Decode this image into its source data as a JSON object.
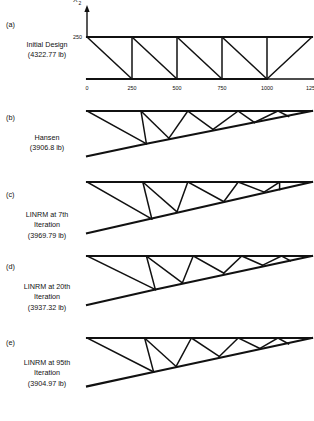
{
  "figure": {
    "line_color": "#111111",
    "background": "#ffffff"
  },
  "chart_data": {
    "type": "line",
    "xlabel": "X 1",
    "ylabel": "X 2",
    "axes": {
      "x_ticks": [
        0,
        250,
        500,
        750,
        1000,
        1250
      ],
      "x_tick_labels": [
        "0",
        "250",
        "500",
        "750",
        "1000",
        "1250"
      ],
      "y_ticks": [
        250
      ],
      "y_tick_labels": [
        "250"
      ],
      "xlim": [
        0,
        1250
      ],
      "ylim": [
        0,
        250
      ],
      "grid": false,
      "legend": "none"
    },
    "panels": [
      {
        "tag": "(a)",
        "name": "Initial Design",
        "weight": "(4322.77 lb)",
        "caption_lines": [
          "Initial Design",
          "(4322.77 lb)"
        ],
        "has_axes": true,
        "top_nodes": [
          [
            0,
            250
          ],
          [
            250,
            250
          ],
          [
            500,
            250
          ],
          [
            750,
            250
          ],
          [
            1000,
            250
          ],
          [
            1250,
            250
          ]
        ],
        "bottom_nodes": [
          [
            0,
            0
          ],
          [
            250,
            0
          ],
          [
            500,
            0
          ],
          [
            750,
            0
          ],
          [
            1000,
            0
          ]
        ],
        "top_chord": [
          [
            0,
            250
          ],
          [
            1250,
            250
          ]
        ],
        "bottom_chord": [
          [
            0,
            0
          ],
          [
            1000,
            0
          ]
        ],
        "web_members": [
          [
            [
              0,
              250
            ],
            [
              250,
              0
            ]
          ],
          [
            [
              250,
              250
            ],
            [
              250,
              0
            ]
          ],
          [
            [
              250,
              250
            ],
            [
              500,
              0
            ]
          ],
          [
            [
              500,
              250
            ],
            [
              500,
              0
            ]
          ],
          [
            [
              500,
              250
            ],
            [
              750,
              0
            ]
          ],
          [
            [
              750,
              250
            ],
            [
              750,
              0
            ]
          ],
          [
            [
              750,
              250
            ],
            [
              1000,
              0
            ]
          ],
          [
            [
              1000,
              250
            ],
            [
              1000,
              0
            ]
          ],
          [
            [
              1250,
              250
            ],
            [
              1000,
              0
            ]
          ]
        ]
      },
      {
        "tag": "(b)",
        "name": "Hansen",
        "weight": "(3906.8 lb)",
        "caption_lines": [
          "Hansen",
          "(3906.8 lb)"
        ],
        "has_axes": false,
        "top_chord": [
          [
            0,
            250
          ],
          [
            1250,
            250
          ]
        ],
        "bottom_chord": [
          [
            0,
            -20
          ],
          [
            330,
            55
          ],
          [
            1250,
            250
          ]
        ],
        "web_members": [
          [
            [
              0,
              250
            ],
            [
              330,
              55
            ]
          ],
          [
            [
              300,
              250
            ],
            [
              330,
              55
            ]
          ],
          [
            [
              300,
              250
            ],
            [
              455,
              88
            ]
          ],
          [
            [
              560,
              250
            ],
            [
              455,
              88
            ]
          ],
          [
            [
              560,
              250
            ],
            [
              700,
              140
            ]
          ],
          [
            [
              840,
              250
            ],
            [
              700,
              140
            ]
          ],
          [
            [
              840,
              250
            ],
            [
              930,
              182
            ]
          ],
          [
            [
              1060,
              250
            ],
            [
              930,
              182
            ]
          ],
          [
            [
              1060,
              250
            ],
            [
              1120,
              218
            ]
          ]
        ]
      },
      {
        "tag": "(c)",
        "name": "LINRM at 7th Iteration",
        "weight": "(3969.79 lb)",
        "caption_lines": [
          "LINRM at 7th",
          "Iteration",
          "(3969.79 lb)"
        ],
        "has_axes": false,
        "top_chord": [
          [
            0,
            250
          ],
          [
            1250,
            250
          ]
        ],
        "bottom_chord": [
          [
            0,
            -55
          ],
          [
            1250,
            250
          ]
        ],
        "web_members": [
          [
            [
              0,
              250
            ],
            [
              360,
              30
            ]
          ],
          [
            [
              310,
              250
            ],
            [
              360,
              30
            ]
          ],
          [
            [
              310,
              250
            ],
            [
              500,
              72
            ]
          ],
          [
            [
              560,
              250
            ],
            [
              500,
              72
            ]
          ],
          [
            [
              560,
              250
            ],
            [
              760,
              133
            ]
          ],
          [
            [
              840,
              250
            ],
            [
              760,
              133
            ]
          ],
          [
            [
              840,
              250
            ],
            [
              985,
              190
            ]
          ],
          [
            [
              1070,
              250
            ],
            [
              985,
              190
            ]
          ],
          [
            [
              1070,
              250
            ],
            [
              1070,
              205
            ]
          ]
        ]
      },
      {
        "tag": "(d)",
        "name": "LINRM at 20th Iteration",
        "weight": "(3937.32 lb)",
        "caption_lines": [
          "LINRM at 20th",
          "Iteration",
          "(3937.32 lb)"
        ],
        "has_axes": false,
        "top_chord": [
          [
            0,
            250
          ],
          [
            1250,
            250
          ]
        ],
        "bottom_chord": [
          [
            0,
            -42
          ],
          [
            380,
            50
          ],
          [
            1250,
            250
          ]
        ],
        "web_members": [
          [
            [
              0,
              250
            ],
            [
              380,
              50
            ]
          ],
          [
            [
              330,
              250
            ],
            [
              380,
              50
            ]
          ],
          [
            [
              330,
              250
            ],
            [
              530,
              90
            ]
          ],
          [
            [
              590,
              250
            ],
            [
              530,
              90
            ]
          ],
          [
            [
              590,
              250
            ],
            [
              760,
              148
            ]
          ],
          [
            [
              860,
              250
            ],
            [
              760,
              148
            ]
          ],
          [
            [
              860,
              250
            ],
            [
              975,
              195
            ]
          ],
          [
            [
              1080,
              250
            ],
            [
              975,
              195
            ]
          ],
          [
            [
              1080,
              250
            ],
            [
              1130,
              222
            ]
          ]
        ]
      },
      {
        "tag": "(e)",
        "name": "LINRM at 95th Iteration",
        "weight": "(3904.97 lb)",
        "caption_lines": [
          "LINRM at 95th",
          "Iteration",
          "(3904.97 lb)"
        ],
        "has_axes": false,
        "top_chord": [
          [
            0,
            250
          ],
          [
            1250,
            250
          ]
        ],
        "bottom_chord": [
          [
            0,
            -38
          ],
          [
            370,
            48
          ],
          [
            1250,
            250
          ]
        ],
        "web_members": [
          [
            [
              0,
              250
            ],
            [
              370,
              48
            ]
          ],
          [
            [
              320,
              250
            ],
            [
              370,
              48
            ]
          ],
          [
            [
              320,
              250
            ],
            [
              495,
              80
            ]
          ],
          [
            [
              580,
              250
            ],
            [
              495,
              80
            ]
          ],
          [
            [
              580,
              250
            ],
            [
              735,
              140
            ]
          ],
          [
            [
              840,
              250
            ],
            [
              735,
              140
            ]
          ],
          [
            [
              840,
              250
            ],
            [
              960,
              188
            ]
          ],
          [
            [
              1060,
              250
            ],
            [
              960,
              188
            ]
          ],
          [
            [
              1060,
              250
            ],
            [
              1120,
              215
            ]
          ]
        ]
      }
    ]
  }
}
